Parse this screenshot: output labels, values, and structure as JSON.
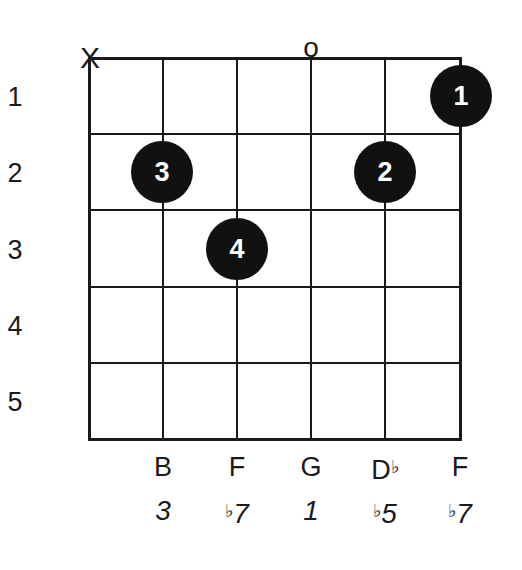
{
  "chord_diagram": {
    "string_markers": [
      "X",
      "",
      "",
      "o",
      "",
      ""
    ],
    "fret_numbers": [
      "1",
      "2",
      "3",
      "4",
      "5"
    ],
    "fingers": [
      {
        "string": 6,
        "fret": 1,
        "finger": "1"
      },
      {
        "string": 2,
        "fret": 2,
        "finger": "3"
      },
      {
        "string": 5,
        "fret": 2,
        "finger": "2"
      },
      {
        "string": 3,
        "fret": 3,
        "finger": "4"
      }
    ],
    "notes": [
      "B",
      "F",
      "G",
      "D",
      "F"
    ],
    "note_accidentals": [
      "",
      "",
      "",
      "♭",
      ""
    ],
    "intervals": [
      "3",
      "7",
      "1",
      "5",
      "7"
    ],
    "interval_accidentals": [
      "",
      "♭",
      "",
      "♭",
      "♭"
    ]
  }
}
